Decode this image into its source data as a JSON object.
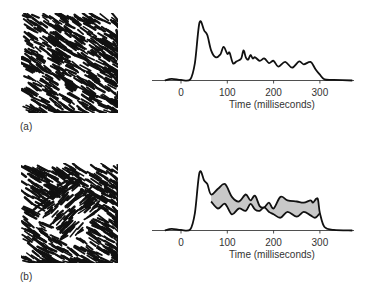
{
  "panels": [
    {
      "label": "(a)",
      "texture": "uniform-oriented-texture",
      "xlabel": "Time (milliseconds)"
    },
    {
      "label": "(b)",
      "texture": "figure-ground-texture",
      "xlabel": "Time (milliseconds)"
    }
  ],
  "colors": {
    "line": "#111111",
    "difference_fill": "#c8c8c8",
    "texture_ink": "#111111"
  },
  "chart_data": [
    {
      "type": "line",
      "title": "",
      "panel": "(a)",
      "xlabel": "Time (milliseconds)",
      "ylabel": "",
      "xlim": [
        -40,
        370
      ],
      "xticks": [
        0,
        100,
        200,
        300
      ],
      "grid": false,
      "series": [
        {
          "name": "response",
          "x": [
            -35,
            -20,
            0,
            20,
            30,
            40,
            50,
            57,
            65,
            75,
            85,
            92,
            100,
            105,
            112,
            120,
            130,
            135,
            140,
            145,
            150,
            155,
            160,
            170,
            180,
            190,
            200,
            210,
            225,
            240,
            255,
            265,
            280,
            290,
            300,
            310,
            330,
            370
          ],
          "y": [
            0,
            0.03,
            0.01,
            0.02,
            0.3,
            1.0,
            0.86,
            0.78,
            0.52,
            0.4,
            0.45,
            0.58,
            0.46,
            0.48,
            0.3,
            0.33,
            0.38,
            0.52,
            0.4,
            0.36,
            0.44,
            0.38,
            0.4,
            0.34,
            0.38,
            0.3,
            0.34,
            0.24,
            0.32,
            0.22,
            0.33,
            0.28,
            0.32,
            0.2,
            0.1,
            0.02,
            0.01,
            0
          ]
        }
      ]
    },
    {
      "type": "line",
      "title": "",
      "panel": "(b)",
      "xlabel": "Time (milliseconds)",
      "ylabel": "",
      "xlim": [
        -40,
        370
      ],
      "xticks": [
        0,
        100,
        200,
        300
      ],
      "grid": false,
      "series": [
        {
          "name": "figure response (upper)",
          "x": [
            -35,
            -20,
            0,
            20,
            30,
            40,
            50,
            57,
            65,
            80,
            95,
            110,
            125,
            140,
            150,
            160,
            170,
            180,
            190,
            200,
            215,
            230,
            250,
            265,
            280,
            285,
            295,
            300,
            310,
            330,
            370
          ],
          "y": [
            0,
            0.03,
            0.01,
            0.02,
            0.3,
            1.0,
            0.86,
            0.8,
            0.62,
            0.72,
            0.8,
            0.58,
            0.5,
            0.62,
            0.52,
            0.6,
            0.42,
            0.4,
            0.48,
            0.38,
            0.58,
            0.52,
            0.5,
            0.48,
            0.52,
            0.48,
            0.55,
            0.3,
            0.06,
            0.01,
            0
          ]
        },
        {
          "name": "ground response (lower)",
          "x": [
            65,
            80,
            95,
            110,
            125,
            140,
            150,
            160,
            170,
            180,
            190,
            200,
            215,
            230,
            250,
            265,
            280,
            290,
            300
          ],
          "y": [
            0.5,
            0.38,
            0.46,
            0.28,
            0.38,
            0.34,
            0.46,
            0.36,
            0.34,
            0.4,
            0.32,
            0.28,
            0.22,
            0.32,
            0.24,
            0.32,
            0.26,
            0.22,
            0.3
          ]
        }
      ],
      "annotations": [
        "shaded region between upper and lower curves marks figure-ground difference"
      ]
    }
  ]
}
